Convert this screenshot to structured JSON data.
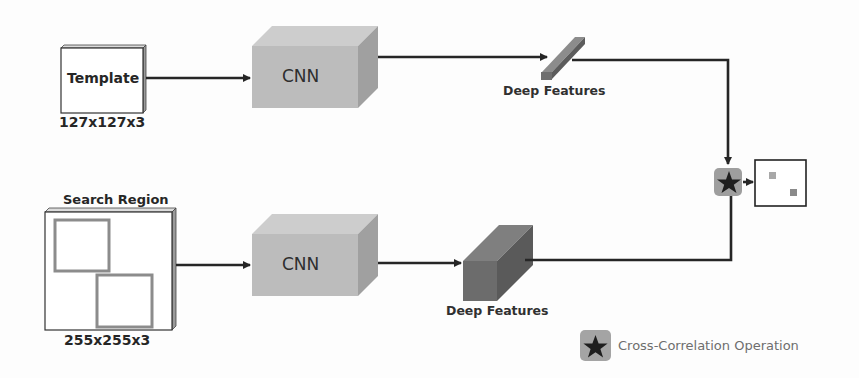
{
  "diagram": {
    "type": "siamese-network-tracking-pipeline",
    "branches": [
      {
        "id": "template-branch",
        "input_label": "Template",
        "input_dims": "127x127x3",
        "network_label": "CNN",
        "features_label": "Deep Features",
        "features_shape": "thin-bar"
      },
      {
        "id": "search-branch",
        "input_label": "Search Region",
        "input_dims": "255x255x3",
        "network_label": "CNN",
        "features_label": "Deep Features",
        "features_shape": "cube"
      }
    ],
    "operator": {
      "icon": "star-icon",
      "glyph": "★",
      "name": "Cross-Correlation Operation"
    },
    "output": {
      "type": "response-map",
      "peaks": 2
    },
    "legend": {
      "items": [
        {
          "icon": "star-icon",
          "glyph": "★",
          "label": "Cross-Correlation Operation"
        }
      ]
    },
    "colors": {
      "cnn_front": "#bdbdbd",
      "cnn_top": "#cfcfcf",
      "cnn_side": "#a3a3a3",
      "feature_front": "#6a6a6a",
      "feature_top": "#8a8a8a",
      "feature_side": "#575757",
      "operator_bg": "#9e9e9e",
      "arrow": "#262626",
      "search_box_border": "#8c8c8c",
      "legend_text": "#6e6e6e"
    }
  }
}
